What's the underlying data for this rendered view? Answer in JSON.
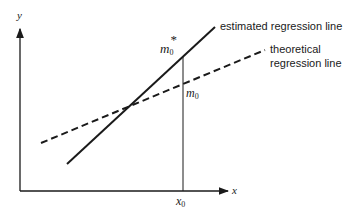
{
  "diagram": {
    "axes": {
      "x_label": "x",
      "y_label": "y"
    },
    "lines": [
      {
        "name": "estimated",
        "style": "solid",
        "label": "estimated regression line"
      },
      {
        "name": "theoretical",
        "style": "dashed",
        "label_line1": "theoretical",
        "label_line2": "regression line"
      }
    ],
    "points": {
      "m0_star": {
        "base": "m",
        "sub": "0",
        "sup": "*"
      },
      "m0": {
        "base": "m",
        "sub": "0"
      },
      "x0": {
        "base": "x",
        "sub": "0"
      }
    }
  }
}
